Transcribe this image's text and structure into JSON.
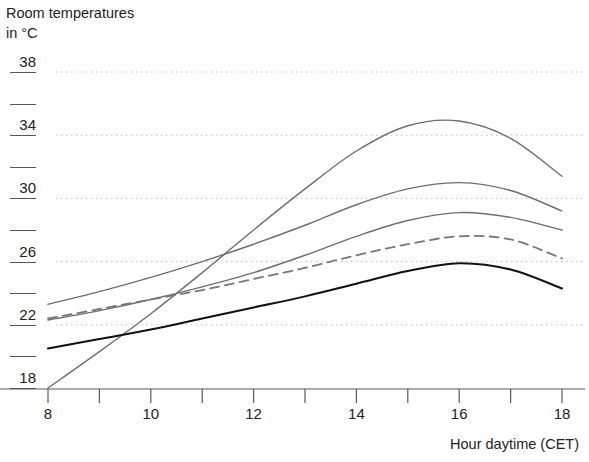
{
  "chart_data": {
    "type": "line",
    "title": "",
    "ylabel": "Room temperatures\nin °C",
    "xlabel": "Hour daytime (CET)",
    "xlim": [
      8,
      18
    ],
    "ylim": [
      16.8,
      39.2
    ],
    "grid": "horizontal-dotted",
    "legend": "none",
    "x_major_ticks": [
      8,
      10,
      12,
      14,
      16,
      18
    ],
    "x_minor_ticks": [
      9,
      11,
      13,
      15,
      17
    ],
    "x_tick_labels": [
      "8",
      "10",
      "12",
      "14",
      "16",
      "18"
    ],
    "y_major_ticks": [
      18,
      22,
      26,
      30,
      34,
      38
    ],
    "y_minor_ticks": [
      20,
      24,
      28,
      32,
      36
    ],
    "y_tick_labels": [
      "18",
      "22",
      "26",
      "30",
      "34",
      "38"
    ],
    "x": [
      8,
      9,
      10,
      11,
      12,
      13,
      14,
      15,
      16,
      17,
      18
    ],
    "series": [
      {
        "name": "curve-1-steep-rise",
        "style": "solid",
        "color": "#6e6e6e",
        "width": 1.4,
        "values": [
          18.0,
          20.3,
          22.7,
          25.3,
          28.0,
          30.6,
          33.0,
          34.6,
          34.9,
          33.8,
          31.4
        ]
      },
      {
        "name": "curve-2-upper",
        "style": "solid",
        "color": "#6e6e6e",
        "width": 1.4,
        "values": [
          23.3,
          24.1,
          25.0,
          26.0,
          27.1,
          28.3,
          29.6,
          30.6,
          31.0,
          30.5,
          29.2
        ]
      },
      {
        "name": "curve-3-middle",
        "style": "solid",
        "color": "#6e6e6e",
        "width": 1.4,
        "values": [
          22.3,
          22.9,
          23.6,
          24.4,
          25.3,
          26.4,
          27.6,
          28.6,
          29.1,
          28.8,
          28.0
        ]
      },
      {
        "name": "curve-4-dashed",
        "style": "dashed",
        "color": "#777777",
        "width": 1.8,
        "dash": "9 6",
        "values": [
          22.4,
          23.0,
          23.6,
          24.2,
          24.9,
          25.6,
          26.4,
          27.1,
          27.6,
          27.4,
          26.2
        ]
      },
      {
        "name": "curve-5-black",
        "style": "solid",
        "color": "#111111",
        "width": 2.0,
        "values": [
          20.5,
          21.1,
          21.7,
          22.4,
          23.1,
          23.8,
          24.6,
          25.4,
          25.9,
          25.5,
          24.3
        ]
      }
    ]
  },
  "axes": {
    "y_title_line1": "Room temperatures",
    "y_title_line2": "in °C",
    "x_title": "Hour daytime (CET)"
  },
  "colors": {
    "axis": "#5a5a5a",
    "grid": "#b9b9b9",
    "text": "#222222",
    "black_curve": "#111111",
    "gray_curve": "#6e6e6e",
    "background": "#ffffff"
  }
}
